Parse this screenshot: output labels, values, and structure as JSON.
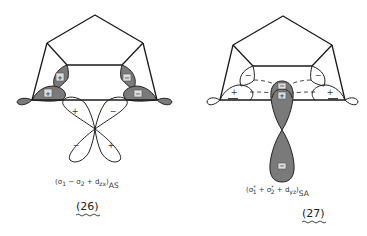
{
  "figures": [
    {
      "id": "26",
      "number_label": "(26)",
      "formula": {
        "open": "(σ",
        "sub1": "1",
        "op1": " − σ",
        "sub2": "2",
        "op2": " + d",
        "sub3": "zx",
        "close": ")",
        "symmetry": "AS"
      },
      "lobe_signs": {
        "upper_left": "+",
        "lower_left": "+",
        "upper_right": "−",
        "lower_right": "−"
      },
      "d_orbital_signs": {
        "top_left": "+",
        "top_right": "−",
        "bottom_left": "−",
        "bottom_right": "+"
      }
    },
    {
      "id": "27",
      "number_label": "(27)",
      "formula": {
        "open": "(σ",
        "sub1": "1",
        "sup1": "*",
        "op1": " + σ",
        "sub2": "2",
        "sup2": "*",
        "op2": " + d",
        "sub3": "yz",
        "close": ")",
        "symmetry": "SA"
      },
      "lobe_signs": {
        "upper_left": "−",
        "lower_left": "+",
        "upper_right": "−",
        "lower_right": "+"
      },
      "d_orbital_signs": {
        "top_upper": "−",
        "top_lower": "+",
        "bottom": "−"
      }
    }
  ],
  "colors": {
    "line": "#1a1a1a",
    "shade": "#7a7a7a",
    "background": "#ffffff"
  }
}
